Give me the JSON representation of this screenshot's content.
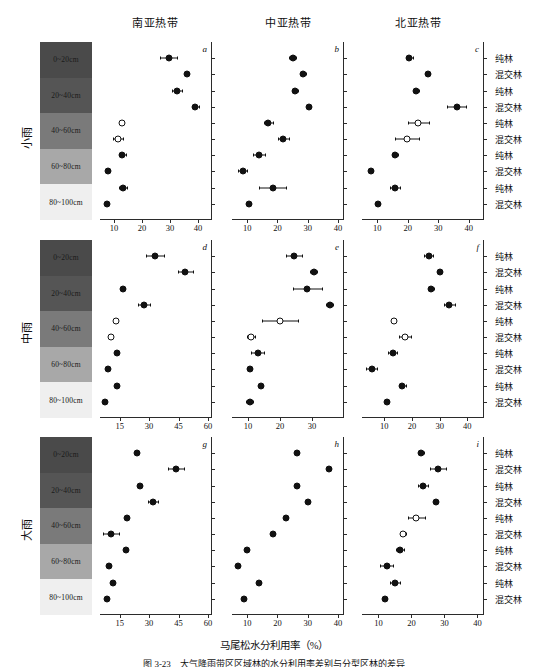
{
  "figure": {
    "xaxis_title": "马尾松水分利用率（%）",
    "caption": "图 3-23　大气降雨带区区域林的水分利用率差别与分型区林的差异",
    "column_headers": [
      "南亚热带",
      "中亚热带",
      "北亚热带"
    ],
    "row_titles": [
      "小雨",
      "中雨",
      "大雨"
    ],
    "depth_labels": [
      "0~20cm",
      "20~40cm",
      "40~60cm",
      "60~80cm",
      "80~100cm"
    ],
    "forest_types": [
      "纯林",
      "混交林",
      "纯林",
      "混交林",
      "纯林",
      "混交林",
      "纯林",
      "混交林",
      "纯林",
      "混交林"
    ],
    "panel_letters": [
      "a",
      "b",
      "c",
      "d",
      "e",
      "f",
      "g",
      "h",
      "i"
    ],
    "marker_colors": {
      "filled": "#111111",
      "open": "#ffffff",
      "line": "#111111"
    },
    "gradient_colors": [
      "#4a4a4a",
      "#555555",
      "#7a7a7a",
      "#a8a8a8",
      "#efefef"
    ]
  },
  "chart_data": [
    {
      "id": "a",
      "type": "scatter",
      "title": "南亚热带",
      "row": "小雨",
      "xlabel": "马尾松水分利用率（%）",
      "ylabel": "",
      "xlim": [
        5,
        45
      ],
      "xticks": [
        10,
        20,
        30,
        40
      ],
      "grid": false,
      "categories": [
        "纯林",
        "混交林",
        "纯林",
        "混交林",
        "纯林",
        "混交林",
        "纯林",
        "混交林",
        "纯林",
        "混交林"
      ],
      "values": [
        29.5,
        36.0,
        32.5,
        39.0,
        12.8,
        11.5,
        13.0,
        8.0,
        13.2,
        7.5
      ],
      "errors": [
        3.0,
        0.8,
        1.8,
        1.2,
        0.8,
        1.8,
        1.2,
        0.6,
        1.5,
        0.5
      ],
      "fill": [
        "filled",
        "filled",
        "filled",
        "filled",
        "open",
        "open",
        "filled",
        "filled",
        "filled",
        "filled"
      ]
    },
    {
      "id": "b",
      "type": "scatter",
      "title": "中亚热带",
      "row": "小雨",
      "xlim": [
        5,
        42
      ],
      "xticks": [
        10,
        20,
        30,
        40
      ],
      "grid": false,
      "categories": [
        "纯林",
        "混交林",
        "纯林",
        "混交林",
        "纯林",
        "混交林",
        "纯林",
        "混交林",
        "纯林",
        "混交林"
      ],
      "values": [
        25.0,
        28.5,
        25.8,
        30.5,
        17.0,
        22.0,
        14.0,
        8.5,
        18.5,
        10.5
      ],
      "errors": [
        1.2,
        0.8,
        1.0,
        0.6,
        1.5,
        1.8,
        2.0,
        1.5,
        4.5,
        0.8
      ],
      "fill": [
        "filled",
        "filled",
        "filled",
        "filled",
        "filled",
        "filled",
        "filled",
        "filled",
        "filled",
        "filled"
      ]
    },
    {
      "id": "c",
      "type": "scatter",
      "title": "北亚热带",
      "row": "小雨",
      "xlim": [
        5,
        45
      ],
      "xticks": [
        10,
        20,
        30,
        40
      ],
      "grid": false,
      "categories": [
        "纯林",
        "混交林",
        "纯林",
        "混交林",
        "纯林",
        "混交林",
        "纯林",
        "混交林",
        "纯林",
        "混交林"
      ],
      "values": [
        20.5,
        26.5,
        22.8,
        36.0,
        23.5,
        19.8,
        15.8,
        8.0,
        15.8,
        10.2
      ],
      "errors": [
        1.2,
        0.8,
        0.8,
        3.0,
        3.5,
        4.0,
        1.0,
        0.5,
        1.5,
        0.8
      ],
      "fill": [
        "filled",
        "filled",
        "filled",
        "filled",
        "open",
        "open",
        "filled",
        "filled",
        "filled",
        "filled"
      ]
    },
    {
      "id": "d",
      "type": "scatter",
      "title": "南亚热带",
      "row": "中雨",
      "xlim": [
        5,
        62
      ],
      "xticks": [
        15,
        30,
        45,
        60
      ],
      "grid": false,
      "categories": [
        "纯林",
        "混交林",
        "纯林",
        "混交林",
        "纯林",
        "混交林",
        "纯林",
        "混交林",
        "纯林",
        "混交林"
      ],
      "values": [
        33.0,
        48.5,
        16.5,
        27.5,
        13.0,
        10.5,
        13.5,
        9.0,
        13.5,
        7.5
      ],
      "errors": [
        4.5,
        4.0,
        1.0,
        3.0,
        0.8,
        0.8,
        0.8,
        0.8,
        0.8,
        0.6
      ],
      "fill": [
        "filled",
        "filled",
        "filled",
        "filled",
        "open",
        "open",
        "filled",
        "filled",
        "filled",
        "filled"
      ]
    },
    {
      "id": "e",
      "type": "scatter",
      "title": "中亚热带",
      "row": "中雨",
      "xlim": [
        5,
        40
      ],
      "xticks": [
        10,
        20,
        30
      ],
      "grid": false,
      "categories": [
        "纯林",
        "混交林",
        "纯林",
        "混交林",
        "纯林",
        "混交林",
        "纯林",
        "混交林",
        "纯林",
        "混交林"
      ],
      "values": [
        24.5,
        30.5,
        28.5,
        35.5,
        20.0,
        11.0,
        13.0,
        10.5,
        14.0,
        10.5
      ],
      "errors": [
        2.5,
        1.0,
        4.5,
        1.0,
        5.5,
        1.2,
        2.0,
        0.8,
        0.8,
        1.2
      ],
      "fill": [
        "filled",
        "filled",
        "filled",
        "filled",
        "open",
        "open",
        "filled",
        "filled",
        "filled",
        "filled"
      ]
    },
    {
      "id": "f",
      "type": "scatter",
      "title": "北亚热带",
      "row": "中雨",
      "xlim": [
        2,
        46
      ],
      "xticks": [
        10,
        20,
        30,
        40
      ],
      "grid": false,
      "categories": [
        "纯林",
        "混交林",
        "纯林",
        "混交林",
        "纯林",
        "混交林",
        "纯林",
        "混交林",
        "纯林",
        "混交林"
      ],
      "values": [
        26.0,
        30.0,
        27.0,
        33.5,
        13.5,
        17.5,
        13.0,
        5.5,
        16.5,
        11.0
      ],
      "errors": [
        1.5,
        0.8,
        0.8,
        2.0,
        0.6,
        2.0,
        1.5,
        2.0,
        1.2,
        0.6
      ],
      "fill": [
        "filled",
        "filled",
        "filled",
        "filled",
        "open",
        "open",
        "filled",
        "filled",
        "filled",
        "filled"
      ]
    },
    {
      "id": "g",
      "type": "scatter",
      "title": "南亚热带",
      "row": "大雨",
      "xlim": [
        5,
        62
      ],
      "xticks": [
        15,
        30,
        45,
        60
      ],
      "grid": false,
      "categories": [
        "纯林",
        "混交林",
        "纯林",
        "混交林",
        "纯林",
        "混交林",
        "纯林",
        "混交林",
        "纯林",
        "混交林"
      ],
      "values": [
        24.0,
        43.5,
        25.5,
        32.0,
        18.5,
        10.5,
        18.0,
        9.5,
        11.5,
        8.5
      ],
      "errors": [
        0.8,
        4.0,
        0.8,
        2.5,
        0.8,
        4.0,
        0.8,
        0.8,
        0.8,
        0.8
      ],
      "fill": [
        "filled",
        "filled",
        "filled",
        "filled",
        "filled",
        "filled",
        "filled",
        "filled",
        "filled",
        "filled"
      ]
    },
    {
      "id": "h",
      "type": "scatter",
      "title": "中亚热带",
      "row": "大雨",
      "xlim": [
        5,
        42
      ],
      "xticks": [
        10,
        20,
        30,
        40
      ],
      "grid": false,
      "categories": [
        "纯林",
        "混交林",
        "纯林",
        "混交林",
        "纯林",
        "混交林",
        "纯林",
        "混交林",
        "纯林",
        "混交林"
      ],
      "values": [
        26.5,
        37.0,
        26.5,
        30.0,
        23.0,
        18.5,
        10.0,
        7.0,
        14.0,
        9.0
      ],
      "errors": [
        0.6,
        0.6,
        0.6,
        0.6,
        0.6,
        0.6,
        0.6,
        0.6,
        0.6,
        0.6
      ],
      "fill": [
        "filled",
        "filled",
        "filled",
        "filled",
        "filled",
        "filled",
        "filled",
        "filled",
        "filled",
        "filled"
      ]
    },
    {
      "id": "i",
      "type": "scatter",
      "title": "北亚热带",
      "row": "大雨",
      "xlim": [
        5,
        42
      ],
      "xticks": [
        10,
        20,
        30,
        40
      ],
      "grid": false,
      "categories": [
        "纯林",
        "混交林",
        "纯林",
        "混交林",
        "纯林",
        "混交林",
        "纯林",
        "混交林",
        "纯林",
        "混交林"
      ],
      "values": [
        23.0,
        28.0,
        23.5,
        27.5,
        21.5,
        17.5,
        16.5,
        12.5,
        15.0,
        12.0
      ],
      "errors": [
        0.8,
        2.5,
        1.5,
        0.6,
        2.5,
        0.8,
        1.2,
        2.0,
        1.5,
        0.6
      ],
      "fill": [
        "filled",
        "filled",
        "filled",
        "filled",
        "open",
        "open",
        "filled",
        "filled",
        "filled",
        "filled"
      ]
    }
  ]
}
